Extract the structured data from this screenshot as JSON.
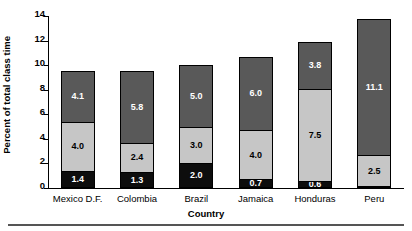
{
  "chart_data": {
    "type": "bar",
    "subtype": "stacked-vertical",
    "title": "",
    "xlabel": "Country",
    "ylabel": "Percent of total class time",
    "categories": [
      "Mexico D.F.",
      "Colombia",
      "Brazil",
      "Jamaica",
      "Honduras",
      "Peru"
    ],
    "series": [
      {
        "name": "bottom-segment",
        "color": "#0d0d0d",
        "values": [
          1.4,
          1.3,
          2.0,
          0.7,
          0.6,
          0.0
        ],
        "labels": [
          "1.4",
          "1.3",
          "2.0",
          "0.7",
          "0.6",
          "0.0"
        ]
      },
      {
        "name": "middle-segment",
        "color": "#c6c6c6",
        "values": [
          4.0,
          2.4,
          3.0,
          4.0,
          7.5,
          2.5
        ],
        "labels": [
          "4.0",
          "2.4",
          "3.0",
          "4.0",
          "7.5",
          "2.5"
        ]
      },
      {
        "name": "top-segment",
        "color": "#595959",
        "values": [
          4.1,
          5.8,
          5.0,
          6.0,
          3.8,
          11.1
        ],
        "labels": [
          "4.1",
          "5.8",
          "5.0",
          "6.0",
          "3.8",
          "11.1"
        ]
      }
    ],
    "totals": [
      9.5,
      9.5,
      10.0,
      10.7,
      11.9,
      13.6
    ],
    "ylim": [
      0,
      14
    ],
    "yticks": [
      0,
      2,
      4,
      6,
      8,
      10,
      12,
      14
    ],
    "ytick_labels": [
      "0",
      "2",
      "4",
      "6",
      "8",
      "10",
      "12",
      "14"
    ],
    "grid": false,
    "legend": "none"
  }
}
